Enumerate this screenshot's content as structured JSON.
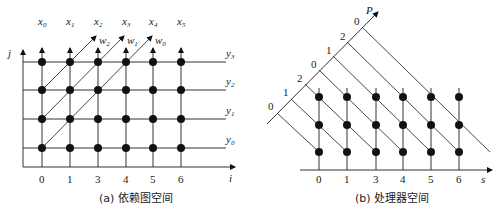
{
  "panel_a": {
    "caption": "(a) 依赖图空间",
    "x_axis_label": "i",
    "y_axis_label": "j",
    "x_ticks": [
      "0",
      "1",
      "3",
      "4",
      "5",
      "6"
    ],
    "top_labels": [
      "x0",
      "x1",
      "x2",
      "x3",
      "x4",
      "x5"
    ],
    "row_labels": [
      "y3",
      "y2",
      "y1",
      "y0"
    ],
    "diagonal_labels": [
      "w2",
      "w1",
      "w0"
    ]
  },
  "panel_b": {
    "caption": "(b) 处理器空间",
    "x_axis_label": "s",
    "p_axis_label": "P",
    "x_ticks": [
      "0",
      "1",
      "3",
      "4",
      "5",
      "6"
    ],
    "p_ticks": [
      "0",
      "1",
      "2",
      "0",
      "1",
      "2",
      "0"
    ]
  }
}
